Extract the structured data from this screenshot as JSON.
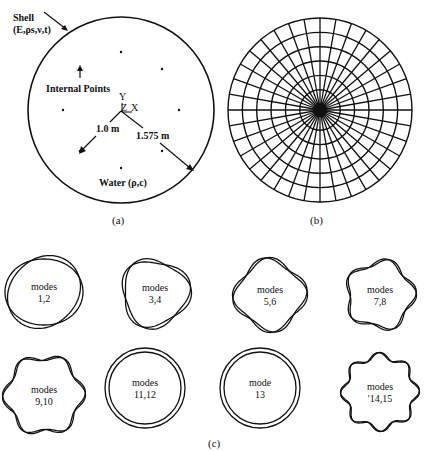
{
  "figure": {
    "panel_a": {
      "caption": "(a)",
      "shell_label_line1": "Shell",
      "shell_label_line2": "(E,ρs,ν,t)",
      "internal_points_label": "Internal Points",
      "axis_y": "Y",
      "axis_z": "Z",
      "axis_x": "X",
      "inner_radius_label": "1.0 m",
      "outer_radius_label": "1.575 m",
      "water_label": "Water (ρ,c)",
      "circle": {
        "cx": 121,
        "cy": 110,
        "r": 93
      },
      "internal_point_count": 8
    },
    "panel_b": {
      "caption": "(b)",
      "description": "boundary/fluid mesh of circular domain",
      "circle": {
        "cx": 320,
        "cy": 110,
        "r": 92
      },
      "rings": 6,
      "spokes": 36
    },
    "panel_c": {
      "caption": "(c)",
      "modes": [
        {
          "label1": "modes",
          "label2": "1,2",
          "n": 2,
          "cx": 44,
          "cy": 292,
          "r": 36
        },
        {
          "label1": "modes",
          "label2": "3,4",
          "n": 3,
          "cx": 155,
          "cy": 293,
          "r": 33
        },
        {
          "label1": "modes",
          "label2": "5,6",
          "n": 4,
          "cx": 270,
          "cy": 295,
          "r": 34
        },
        {
          "label1": "modes",
          "label2": "7,8",
          "n": 5,
          "cx": 380,
          "cy": 295,
          "r": 33
        },
        {
          "label1": "modes",
          "label2": "9,10",
          "n": 6,
          "cx": 44,
          "cy": 395,
          "r": 38
        },
        {
          "label1": "modes",
          "label2": "11,12",
          "n": 0,
          "cx": 145,
          "cy": 388,
          "r": 40
        },
        {
          "label1": "mode",
          "label2": "13",
          "n": 0,
          "cx": 260,
          "cy": 388,
          "r": 40
        },
        {
          "label1": "modes",
          "label2": "'14,15",
          "n": 8,
          "cx": 380,
          "cy": 392,
          "r": 36
        }
      ]
    }
  }
}
